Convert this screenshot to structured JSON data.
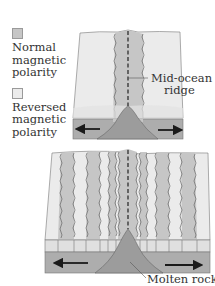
{
  "legend": {
    "items": [
      {
        "label_lines": [
          "Normal",
          "magnetic",
          "polarity"
        ],
        "color": "#c6c6c6"
      },
      {
        "label_lines": [
          "Reversed",
          "magnetic",
          "polarity"
        ],
        "color": "#ebebeb"
      }
    ]
  },
  "labels": {
    "ridge_line1": "Mid-ocean",
    "ridge_line2": "ridge",
    "molten": "Molten rock"
  },
  "colors": {
    "normal": "#c6c6c6",
    "reversed": "#ebebeb",
    "side_surface": "#e4e4e4",
    "mantle": "#adadad",
    "magma": "#9c9c9c",
    "outline": "#666666",
    "arrow": "#1a1a1a"
  }
}
